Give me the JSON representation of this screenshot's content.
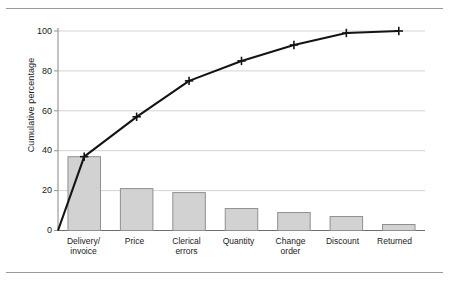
{
  "figure": {
    "background_color": "#ffffff",
    "rule_color": "#9a9a9a"
  },
  "chart_data": {
    "type": "bar",
    "title": "",
    "subtitle": "",
    "xlabel": "",
    "ylabel": "Cumulative percentage",
    "categories": [
      "Delivery/\ninvoice",
      "Price",
      "Clerical\nerrors",
      "Quantity",
      "Change\norder",
      "Discount",
      "Returned"
    ],
    "category_plain": [
      "Delivery/invoice",
      "Price",
      "Clerical errors",
      "Quantity",
      "Change order",
      "Discount",
      "Returned"
    ],
    "values": [
      37,
      21,
      19,
      11,
      9,
      7,
      3
    ],
    "series": [
      {
        "name": "Frequency percentage",
        "type": "bar",
        "values": [
          37,
          21,
          19,
          11,
          9,
          7,
          3
        ]
      },
      {
        "name": "Cumulative percentage",
        "type": "line",
        "values": [
          37,
          57,
          75,
          85,
          93,
          99,
          100
        ]
      }
    ],
    "cumulative": [
      37,
      57,
      75,
      85,
      93,
      99,
      100
    ],
    "ylim": [
      0,
      105
    ],
    "yticks": [
      0,
      20,
      40,
      60,
      80,
      100
    ],
    "ytick_labels": [
      "0",
      "20",
      "40",
      "60",
      "80",
      "100"
    ],
    "grid": true,
    "grid_axis": "y",
    "legend": false,
    "legend_position": "none",
    "bar_fill_color": "#d2d2d2",
    "bar_edge_color": "#8f8f8f",
    "line_color": "#141414",
    "marker": "plus",
    "gridline_color": "#cfcfcf",
    "axis_color": "#9a9a9a",
    "line_origin_value": 0
  }
}
